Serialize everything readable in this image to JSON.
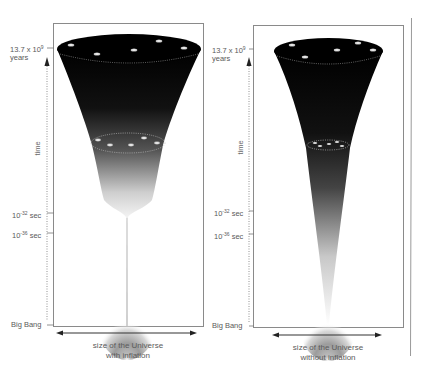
{
  "panels": [
    {
      "id": "with-inflation",
      "labels": {
        "now_mantissa": "13.7 x 10",
        "now_exp": "9",
        "now_unit": "years",
        "t1_base": "10",
        "t1_exp": "-32",
        "t1_unit": "sec",
        "t2_base": "10",
        "t2_exp": "-36",
        "t2_unit": "sec",
        "origin": "Big Bang",
        "axis": "time"
      },
      "caption_line1": "size of the Universe",
      "caption_line2": "with inflation"
    },
    {
      "id": "without-inflation",
      "labels": {
        "now_mantissa": "13.7 x 10",
        "now_exp": "9",
        "now_unit": "years",
        "t1_base": "10",
        "t1_exp": "-32",
        "t1_unit": "sec",
        "t2_base": "10",
        "t2_exp": "-36",
        "t2_unit": "sec",
        "origin": "Big Bang",
        "axis": "time"
      },
      "caption_line1": "size of the Universe",
      "caption_line2": "without inflation"
    }
  ],
  "colors": {
    "frame": "#8a8a8a",
    "funnel_dark": "#000000",
    "funnel_light": "#ffffff",
    "galaxy": "#e8e8e8",
    "text": "#5a5a5a"
  }
}
